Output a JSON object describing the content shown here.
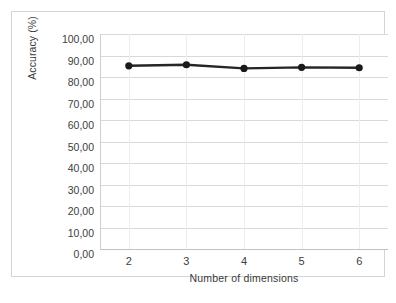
{
  "chart_data": {
    "type": "line",
    "title": "",
    "xlabel": "Number of dimensions",
    "ylabel": "Accuracy (%)",
    "x": [
      2,
      3,
      4,
      5,
      6
    ],
    "categories": [
      "2",
      "3",
      "4",
      "5",
      "6"
    ],
    "values": [
      85.2,
      85.7,
      84.0,
      84.5,
      84.3
    ],
    "series": [
      {
        "name": "Accuracy",
        "values": [
          85.2,
          85.7,
          84.0,
          84.5,
          84.3
        ]
      }
    ],
    "xlim": [
      1.5,
      6.5
    ],
    "ylim": [
      0,
      100
    ],
    "ytick_labels": [
      "100,00",
      "90,00",
      "80,00",
      "70,00",
      "60,00",
      "50,00",
      "40,00",
      "30,00",
      "20,00",
      "10,00",
      "0,00"
    ],
    "ytick_values": [
      100,
      90,
      80,
      70,
      60,
      50,
      40,
      30,
      20,
      10,
      0
    ],
    "xtick_labels": [
      "2",
      "3",
      "4",
      "5",
      "6"
    ],
    "grid": "horizontal-and-faint-vertical",
    "legend": "none",
    "marker": "filled-circle",
    "line_color": "#262626",
    "marker_color": "#1a1a1a",
    "grid_color": "#d9d9d9",
    "frame_color": "#d4d4d4",
    "plot_background": "#ffffff"
  },
  "figure": {
    "background": "#ffffff",
    "frame_label": "chart-frame"
  }
}
